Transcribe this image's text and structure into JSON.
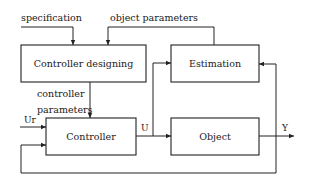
{
  "diagram": {
    "type": "block-diagram",
    "blocks": [
      {
        "id": "controller_designing",
        "label": "Controller designing"
      },
      {
        "id": "estimation",
        "label": "Estimation"
      },
      {
        "id": "controller",
        "label": "Controller"
      },
      {
        "id": "object",
        "label": "Object"
      }
    ],
    "signals": {
      "specification": "specification",
      "object_parameters": "object parameters",
      "controller_parameters_line1": "controller",
      "controller_parameters_line2": "parameters",
      "reference_input": "Ur",
      "control_signal": "U",
      "output": "Y"
    },
    "edges": [
      {
        "from": "specification",
        "to": "controller_designing"
      },
      {
        "from": "estimation",
        "to": "controller_designing",
        "label": "object parameters"
      },
      {
        "from": "controller_designing",
        "to": "controller",
        "label": "controller parameters"
      },
      {
        "from": "Ur",
        "to": "controller"
      },
      {
        "from": "controller",
        "to": "object",
        "label": "U"
      },
      {
        "from": "controller",
        "to": "estimation",
        "label": "U"
      },
      {
        "from": "object",
        "to": "Y",
        "label": "Y"
      },
      {
        "from": "Y",
        "to": "estimation"
      },
      {
        "from": "Y",
        "to": "controller",
        "label": "feedback"
      }
    ],
    "colors": {
      "stroke": "#222222",
      "background": "#ffffff"
    }
  }
}
